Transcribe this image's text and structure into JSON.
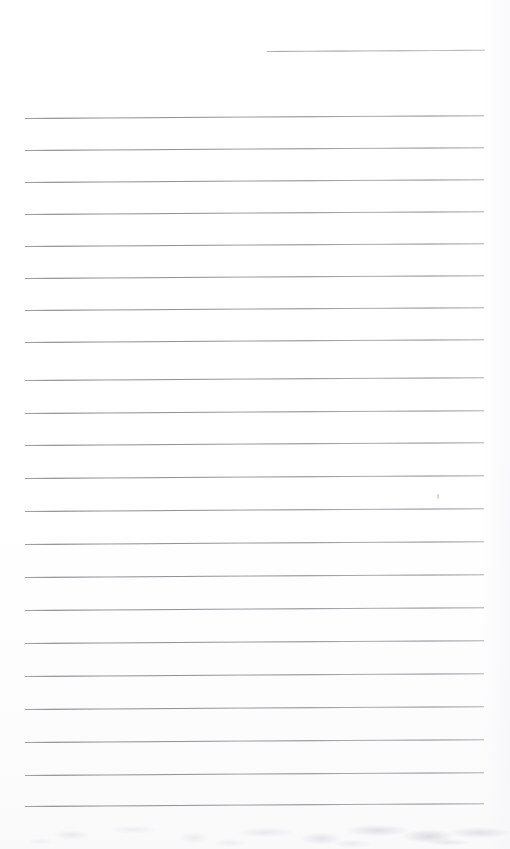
{
  "document": {
    "kind": "scanned-lined-page",
    "description": "Blank ruled notebook page scan",
    "page_width": 510,
    "page_height": 849,
    "background_color": "#ffffff",
    "rule_color": "#b4b4ba",
    "text_content": "",
    "visible_text": []
  },
  "ruling": {
    "line_count": 23,
    "left_margin_x": 25,
    "right_margin_x": 484,
    "average_spacing": 32.2,
    "tilt_degrees": -0.35,
    "lines": [
      {
        "index": 1,
        "x": 267,
        "y": 51,
        "width": 218,
        "partial": true
      },
      {
        "index": 2,
        "x": 25,
        "y": 118,
        "width": 459,
        "partial": false
      },
      {
        "index": 3,
        "x": 25,
        "y": 150,
        "width": 459,
        "partial": false
      },
      {
        "index": 4,
        "x": 25,
        "y": 182,
        "width": 459,
        "partial": false
      },
      {
        "index": 5,
        "x": 25,
        "y": 214,
        "width": 459,
        "partial": false
      },
      {
        "index": 6,
        "x": 25,
        "y": 246,
        "width": 459,
        "partial": false
      },
      {
        "index": 7,
        "x": 25,
        "y": 278,
        "width": 459,
        "partial": false
      },
      {
        "index": 8,
        "x": 25,
        "y": 310,
        "width": 459,
        "partial": false
      },
      {
        "index": 9,
        "x": 25,
        "y": 342,
        "width": 459,
        "partial": false
      },
      {
        "index": 10,
        "x": 25,
        "y": 380,
        "width": 459,
        "partial": false
      },
      {
        "index": 11,
        "x": 25,
        "y": 413,
        "width": 459,
        "partial": false
      },
      {
        "index": 12,
        "x": 25,
        "y": 445,
        "width": 459,
        "partial": false
      },
      {
        "index": 13,
        "x": 25,
        "y": 478,
        "width": 459,
        "partial": false
      },
      {
        "index": 14,
        "x": 25,
        "y": 511,
        "width": 459,
        "partial": false
      },
      {
        "index": 15,
        "x": 25,
        "y": 544,
        "width": 459,
        "partial": false
      },
      {
        "index": 16,
        "x": 25,
        "y": 577,
        "width": 459,
        "partial": false
      },
      {
        "index": 17,
        "x": 25,
        "y": 610,
        "width": 459,
        "partial": false
      },
      {
        "index": 18,
        "x": 25,
        "y": 643,
        "width": 459,
        "partial": false
      },
      {
        "index": 19,
        "x": 25,
        "y": 676,
        "width": 459,
        "partial": false
      },
      {
        "index": 20,
        "x": 25,
        "y": 709,
        "width": 459,
        "partial": false
      },
      {
        "index": 21,
        "x": 25,
        "y": 742,
        "width": 459,
        "partial": false
      },
      {
        "index": 22,
        "x": 25,
        "y": 775,
        "width": 459,
        "partial": false
      },
      {
        "index": 23,
        "x": 25,
        "y": 806,
        "width": 459,
        "partial": false
      }
    ]
  },
  "artifacts": {
    "speck": {
      "x": 437,
      "y": 494
    },
    "bottom_noise_band": {
      "y": 812,
      "height": 37
    },
    "right_scan_band": {
      "x": 484,
      "width": 26
    }
  }
}
